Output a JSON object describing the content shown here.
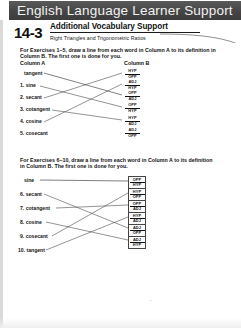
{
  "banner": {
    "title": "English Language Learner Support"
  },
  "lesson": {
    "number": "14-3",
    "title": "Additional Vocabulary Support",
    "subtitle": "Right Triangles and Trigonometric Ratios"
  },
  "exercise_1": {
    "instructions": "For Exercises 1–5, draw a line from each word in Column A to its definition in Column B. The first one is done for you.",
    "column_a_header": "Column A",
    "column_b_header": "Column B",
    "column_a": [
      {
        "num": "",
        "word": "tangent"
      },
      {
        "num": "1.",
        "word": "sine"
      },
      {
        "num": "2.",
        "word": "secant"
      },
      {
        "num": "3.",
        "word": "cotangent"
      },
      {
        "num": "4.",
        "word": "cosine"
      },
      {
        "num": "5.",
        "word": "cosecant"
      }
    ],
    "column_b": [
      {
        "top": "HYP",
        "bottom": "OPP"
      },
      {
        "top": "ADJ",
        "bottom": "HYP"
      },
      {
        "top": "OPP",
        "bottom": "ADJ"
      },
      {
        "top": "OPP",
        "bottom": "HYP"
      },
      {
        "top": "HYP",
        "bottom": "ADJ"
      },
      {
        "top": "ADJ",
        "bottom": "OPP"
      }
    ]
  },
  "exercise_2": {
    "instructions": "For Exercises 6–10, draw a line from each word in Column A to its definition in Column B. The first one is done for you.",
    "column_a": [
      {
        "num": "",
        "word": "sine"
      },
      {
        "num": "6.",
        "word": "secant"
      },
      {
        "num": "7.",
        "word": "cotangent"
      },
      {
        "num": "8.",
        "word": "cosine"
      },
      {
        "num": "9.",
        "word": "cosecant"
      },
      {
        "num": "10.",
        "word": "tangent"
      }
    ],
    "column_b": [
      {
        "top": "OPP",
        "bottom": "HYP"
      },
      {
        "top": "HYP",
        "bottom": "OPP"
      },
      {
        "top": "OPP",
        "bottom": "ADJ"
      },
      {
        "top": "HYP",
        "bottom": "ADJ"
      },
      {
        "top": "ADJ",
        "bottom": "OPP"
      },
      {
        "top": "ADJ",
        "bottom": "HYP"
      }
    ]
  },
  "colors": {
    "banner_bg": "#4a4a4a",
    "banner_text": "#f2f2f2",
    "ink": "#141414"
  }
}
